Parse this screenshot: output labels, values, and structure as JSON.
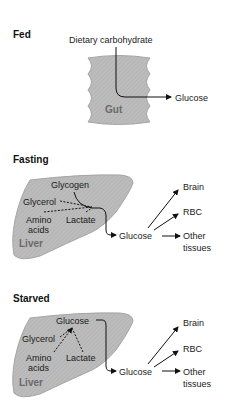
{
  "diagram": {
    "colors": {
      "organ_fill": "#b9b9b9",
      "organ_edge": "#9a9a9a",
      "line": "#111111",
      "organ_label": "#6a6a6a"
    },
    "fed": {
      "title": "Fed",
      "source": "Dietary carbohydrate",
      "organ": "Gut",
      "output": "Glucose"
    },
    "fasting": {
      "title": "Fasting",
      "organ": "Liver",
      "sources": [
        "Glycogen",
        "Glycerol",
        "Amino",
        "acids",
        "Lactate"
      ],
      "output": "Glucose",
      "targets": [
        "Brain",
        "RBC",
        "Other",
        "tissues"
      ]
    },
    "starved": {
      "title": "Starved",
      "organ": "Liver",
      "internal_product": "Glucose",
      "sources": [
        "Glycerol",
        "Amino",
        "acids",
        "Lactate"
      ],
      "output": "Glucose",
      "targets": [
        "Brain",
        "RBC",
        "Other",
        "tissues"
      ]
    }
  }
}
